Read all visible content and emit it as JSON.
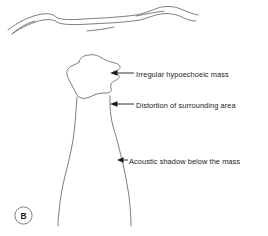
{
  "figure": {
    "panel_letter": "B",
    "modality_depicted": "ultrasound line drawing",
    "background_color": "#ffffff",
    "line_color": "#6f6f6f",
    "arrow_color": "#1b1b1b",
    "text_color": "#1b1b1b"
  },
  "annotations": [
    {
      "id": "mass",
      "text": "Irregular hypoechoeic mass",
      "arrow_direction": "left",
      "arrow_tip": [
        110,
        73
      ],
      "arrow_tail": [
        134,
        73
      ]
    },
    {
      "id": "distortion",
      "text": "Distortion of surrounding area",
      "arrow_direction": "left",
      "arrow_tip": [
        110,
        104
      ],
      "arrow_tail": [
        134,
        104
      ]
    },
    {
      "id": "shadow",
      "text": "Acoustic shadow below the mass",
      "arrow_direction": "left",
      "arrow_tip": [
        117,
        160
      ],
      "arrow_tail": [
        128,
        160
      ]
    }
  ],
  "structures": [
    {
      "id": "tissue-layer-upper",
      "label": "superficial tissue interface line"
    },
    {
      "id": "tissue-layer-lower",
      "label": "deeper tissue interface line"
    },
    {
      "id": "tissue-fragment-left",
      "label": "short left tissue line segment"
    },
    {
      "id": "tissue-fragment-mid",
      "label": "short mid tissue line segment"
    },
    {
      "id": "tissue-fragment-right",
      "label": "short right tissue line segment"
    },
    {
      "id": "irregular-mass",
      "label": "irregular hypoechoeic mass outline"
    },
    {
      "id": "acoustic-shadow-left-edge",
      "label": "left border of acoustic shadow"
    },
    {
      "id": "acoustic-shadow-right-edge",
      "label": "right border of acoustic shadow"
    }
  ]
}
